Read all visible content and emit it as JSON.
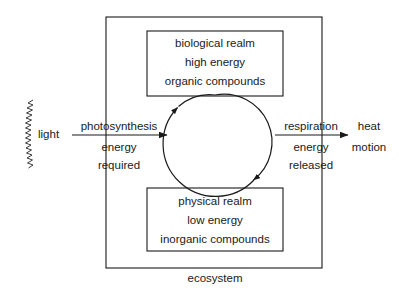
{
  "diagram": {
    "title_label": "ecosystem",
    "boxes": {
      "biological": {
        "name": "biological realm",
        "line1": "biological realm",
        "line2": "high energy",
        "line3": "organic  compounds"
      },
      "physical": {
        "name": "physical realm",
        "line1": "physical  realm",
        "line2": "low energy",
        "line3": "inorganic compounds"
      }
    },
    "inputs": {
      "light_label": "light"
    },
    "left_flow": {
      "line1": "photosynthesis",
      "line2": "energy",
      "line3": "required"
    },
    "right_flow": {
      "line1": "respiration",
      "line2": "energy",
      "line3": "released"
    },
    "outputs": {
      "line1": "heat",
      "line2": "motion"
    },
    "cycle": {
      "direction": "clockwise",
      "up_arrow_name": "cycle-arrow-up",
      "down_arrow_name": "cycle-arrow-down"
    },
    "colors": {
      "stroke": "#1a1a1a",
      "text": "#1a1a1a",
      "background": "#ffffff"
    }
  }
}
